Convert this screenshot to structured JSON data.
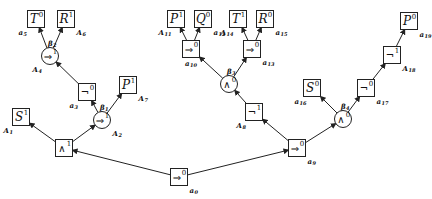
{
  "diagram": {
    "type": "tableau-tree",
    "nodes": [
      {
        "id": "n0",
        "shape": "box",
        "symbol": "⇒",
        "sup": "0",
        "label": "a",
        "label_sub": "0",
        "x": 179,
        "y": 177,
        "label_pos": "br"
      },
      {
        "id": "n1",
        "shape": "box",
        "symbol": "∧",
        "sup": "1",
        "label": "",
        "label_sub": "",
        "x": 64,
        "y": 148,
        "label_pos": "none"
      },
      {
        "id": "n2",
        "shape": "box",
        "symbol": "S",
        "sup": "1",
        "label": "A",
        "label_sub": "1",
        "x": 21,
        "y": 117,
        "label_pos": "bl"
      },
      {
        "id": "n3",
        "shape": "circle",
        "symbol": "⇒",
        "sup": "1",
        "label": "A",
        "label_sub": "2",
        "x": 102,
        "y": 120,
        "label_pos": "br",
        "beta": "β",
        "beta_sub": "1"
      },
      {
        "id": "n4",
        "shape": "box",
        "symbol": "¬",
        "sup": "0",
        "label": "a",
        "label_sub": "3",
        "x": 87,
        "y": 92,
        "label_pos": "bl"
      },
      {
        "id": "n5",
        "shape": "box",
        "symbol": "P",
        "sup": "1",
        "label": "A",
        "label_sub": "7",
        "x": 128,
        "y": 85,
        "label_pos": "br"
      },
      {
        "id": "n6",
        "shape": "circle",
        "symbol": "⇒",
        "sup": "1",
        "label": "A",
        "label_sub": "4",
        "x": 50,
        "y": 56,
        "label_pos": "bl",
        "beta": "β",
        "beta_sub": "2"
      },
      {
        "id": "n7",
        "shape": "box",
        "symbol": "T",
        "sup": "0",
        "label": "a",
        "label_sub": "5",
        "x": 36,
        "y": 19,
        "label_pos": "bl"
      },
      {
        "id": "n8",
        "shape": "box",
        "symbol": "R",
        "sup": "1",
        "label": "A",
        "label_sub": "6",
        "x": 66,
        "y": 19,
        "label_pos": "br"
      },
      {
        "id": "n9",
        "shape": "box",
        "symbol": "⇒",
        "sup": "0",
        "label": "a",
        "label_sub": "9",
        "x": 297,
        "y": 148,
        "label_pos": "br"
      },
      {
        "id": "n10",
        "shape": "box",
        "symbol": "¬",
        "sup": "1",
        "label": "A",
        "label_sub": "8",
        "x": 254,
        "y": 112,
        "label_pos": "bl"
      },
      {
        "id": "n11",
        "shape": "circle",
        "symbol": "∧",
        "sup": "0",
        "label": "",
        "label_sub": "",
        "x": 229,
        "y": 84,
        "label_pos": "none",
        "beta": "β",
        "beta_sub": "3"
      },
      {
        "id": "n12",
        "shape": "box",
        "symbol": "⇒",
        "sup": "0",
        "label": "a",
        "label_sub": "10",
        "x": 191,
        "y": 49,
        "label_pos": "b"
      },
      {
        "id": "n13",
        "shape": "box",
        "symbol": "P",
        "sup": "1",
        "label": "A",
        "label_sub": "11",
        "x": 176,
        "y": 19,
        "label_pos": "bl"
      },
      {
        "id": "n14",
        "shape": "box",
        "symbol": "Q",
        "sup": "0",
        "label": "a",
        "label_sub": "12",
        "x": 203,
        "y": 19,
        "label_pos": "br"
      },
      {
        "id": "n15",
        "shape": "box",
        "symbol": "⇒",
        "sup": "0",
        "label": "a",
        "label_sub": "13",
        "x": 252,
        "y": 49,
        "label_pos": "br"
      },
      {
        "id": "n16",
        "shape": "box",
        "symbol": "T",
        "sup": "1",
        "label": "A",
        "label_sub": "14",
        "x": 238,
        "y": 19,
        "label_pos": "bl"
      },
      {
        "id": "n17",
        "shape": "box",
        "symbol": "R",
        "sup": "0",
        "label": "a",
        "label_sub": "15",
        "x": 265,
        "y": 19,
        "label_pos": "br"
      },
      {
        "id": "n18",
        "shape": "circle",
        "symbol": "∧",
        "sup": "0",
        "label": "",
        "label_sub": "",
        "x": 343,
        "y": 119,
        "label_pos": "none",
        "beta": "β",
        "beta_sub": "4"
      },
      {
        "id": "n19",
        "shape": "box",
        "symbol": "S",
        "sup": "0",
        "label": "a",
        "label_sub": "16",
        "x": 312,
        "y": 88,
        "label_pos": "bl"
      },
      {
        "id": "n20",
        "shape": "box",
        "symbol": "¬",
        "sup": "0",
        "label": "a",
        "label_sub": "17",
        "x": 366,
        "y": 88,
        "label_pos": "br"
      },
      {
        "id": "n21",
        "shape": "box",
        "symbol": "¬",
        "sup": "1",
        "label": "A",
        "label_sub": "18",
        "x": 392,
        "y": 55,
        "label_pos": "br"
      },
      {
        "id": "n22",
        "shape": "box",
        "symbol": "P",
        "sup": "0",
        "label": "a",
        "label_sub": "19",
        "x": 409,
        "y": 21,
        "label_pos": "br"
      }
    ],
    "edges": [
      [
        "n0",
        "n1"
      ],
      [
        "n0",
        "n9"
      ],
      [
        "n1",
        "n2"
      ],
      [
        "n1",
        "n3"
      ],
      [
        "n3",
        "n4"
      ],
      [
        "n3",
        "n5"
      ],
      [
        "n4",
        "n6"
      ],
      [
        "n6",
        "n7"
      ],
      [
        "n6",
        "n8"
      ],
      [
        "n9",
        "n10"
      ],
      [
        "n9",
        "n18"
      ],
      [
        "n10",
        "n11"
      ],
      [
        "n11",
        "n12"
      ],
      [
        "n11",
        "n15"
      ],
      [
        "n12",
        "n13"
      ],
      [
        "n12",
        "n14"
      ],
      [
        "n15",
        "n16"
      ],
      [
        "n15",
        "n17"
      ],
      [
        "n18",
        "n19"
      ],
      [
        "n18",
        "n20"
      ],
      [
        "n20",
        "n21"
      ],
      [
        "n21",
        "n22"
      ]
    ]
  }
}
